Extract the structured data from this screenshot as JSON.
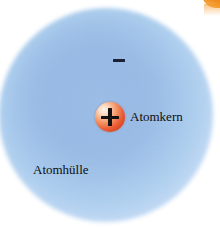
{
  "figure": {
    "language": "de",
    "background_color": "#ffffff"
  },
  "shell": {
    "name": "Atomhülle",
    "label": "Atomhülle",
    "shape": "circle",
    "center_x": 106,
    "center_y": 115,
    "radius": 107,
    "color_edge": "#cfe1f7",
    "color_mid": "#9cbee6"
  },
  "nucleus": {
    "name": "Atomkern",
    "label": "Atomkern",
    "charge_symbol": "+",
    "shape": "sphere",
    "center_x": 110,
    "center_y": 117,
    "radius": 15,
    "color": "#ea5f37",
    "highlight_color": "#fdf6ef"
  },
  "electron": {
    "charge_symbol": "−",
    "center_x": 119,
    "center_y": 61,
    "color": "#1b2235"
  },
  "artifact": {
    "name": "corner-scan-artifact",
    "color": "#f59422"
  }
}
